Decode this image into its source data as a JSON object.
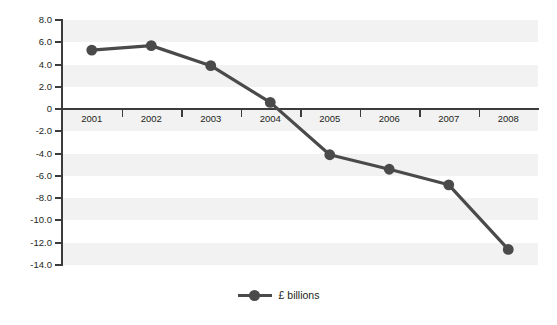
{
  "chart_data": {
    "type": "line",
    "title": "",
    "subtitle": "",
    "xlabel": "",
    "ylabel": "",
    "categories": [
      "2001",
      "2002",
      "2003",
      "2004",
      "2005",
      "2006",
      "2007",
      "2008"
    ],
    "series": [
      {
        "name": "£ billions",
        "color": "#4a4a4a",
        "values": [
          5.3,
          5.7,
          3.9,
          0.6,
          -4.1,
          -5.4,
          -6.8,
          -12.6
        ]
      }
    ],
    "ylim": [
      -14.0,
      8.0
    ],
    "yticks": [
      8.0,
      6.0,
      4.0,
      2.0,
      0,
      -2.0,
      -4.0,
      -6.0,
      -8.0,
      -10.0,
      -12.0,
      -14.0
    ],
    "ytick_labels": [
      "8.0",
      "6.0",
      "4.0",
      "2.0",
      "0",
      "-2.0",
      "-4.0",
      "-6.0",
      "-8.0",
      "-10.0",
      "-12.0",
      "-14.0"
    ],
    "grid": false,
    "banding": true,
    "band_color": "#f2f2f2",
    "axis_color": "#3c3c3c",
    "legend": {
      "position": "bottom-center",
      "entries": [
        {
          "label": "£ billions",
          "color": "#4a4a4a",
          "marker": "circle"
        }
      ]
    }
  }
}
